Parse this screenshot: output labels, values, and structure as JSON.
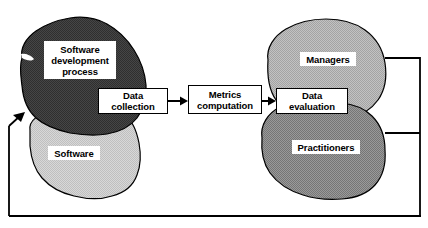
{
  "diagram": {
    "type": "flow-diagram",
    "background_color": "#ffffff",
    "line_color": "#000000",
    "blobs": [
      {
        "id": "software-development-process",
        "label": "Software\ndevelopment\nprocess",
        "fill": "#4d4d4d",
        "role": "source-entity"
      },
      {
        "id": "software",
        "label": "Software",
        "fill": "#cfcfcf",
        "role": "source-entity"
      },
      {
        "id": "managers",
        "label": "Managers",
        "fill": "#b3b3b3",
        "role": "consumer-entity"
      },
      {
        "id": "practitioners",
        "label": "Practitioners",
        "fill": "#8a8a8a",
        "role": "consumer-entity"
      }
    ],
    "process_boxes": [
      {
        "id": "data-collection",
        "label": "Data\ncollection"
      },
      {
        "id": "metrics-computation",
        "label": "Metrics\ncomputation"
      },
      {
        "id": "data-evaluation",
        "label": "Data\nevaluation"
      }
    ],
    "connectors": [
      {
        "id": "arrow-collection-to-metrics",
        "from": "data-collection",
        "to": "metrics-computation",
        "style": "arrow-right"
      },
      {
        "id": "arrow-metrics-to-evaluation",
        "from": "metrics-computation",
        "to": "data-evaluation",
        "style": "arrow-right"
      },
      {
        "id": "line-managers-out",
        "from": "managers",
        "to": "feedback-bus",
        "style": "line"
      },
      {
        "id": "line-practitioners-out",
        "from": "practitioners",
        "to": "feedback-bus",
        "style": "line"
      },
      {
        "id": "feedback-bus",
        "from": "consumers",
        "to": "feedback-return",
        "style": "line-vertical"
      },
      {
        "id": "feedback-return",
        "from": "feedback-bus",
        "to": "software-development-process",
        "style": "arrow-up"
      }
    ]
  }
}
